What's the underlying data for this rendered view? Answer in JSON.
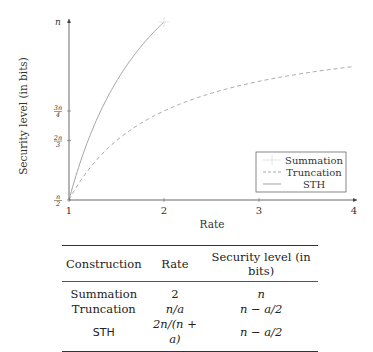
{
  "chart_data": {
    "type": "line",
    "title": "",
    "xlabel": "Rate",
    "ylabel": "Security level (in bits)",
    "xlim": [
      1,
      4
    ],
    "ylim": [
      "n/2",
      "n"
    ],
    "x_ticks": [
      "1",
      "2",
      "3",
      "4"
    ],
    "y_ticks": [
      {
        "label": "n/2",
        "value": 0.5
      },
      {
        "label": "2n/3",
        "value": 0.6667
      },
      {
        "label": "3n/4",
        "value": 0.75
      },
      {
        "label": "n",
        "value": 1.0
      }
    ],
    "y_unit": "fraction of n",
    "grid": false,
    "legend_position": "lower right",
    "series": [
      {
        "name": "Summation",
        "style": "marker (+)",
        "x": [
          2
        ],
        "y": [
          1.0
        ]
      },
      {
        "name": "Truncation",
        "style": "dashed",
        "formula": "n - n/(2r)",
        "x": [
          1,
          1.5,
          2,
          2.5,
          3,
          3.5,
          4
        ],
        "y": [
          0.5,
          0.667,
          0.75,
          0.8,
          0.833,
          0.857,
          0.875
        ]
      },
      {
        "name": "STH",
        "style": "solid",
        "formula": "3n/2 - n/r",
        "x": [
          1,
          1.25,
          1.5,
          1.75,
          2
        ],
        "y": [
          0.5,
          0.7,
          0.833,
          0.929,
          1.0
        ]
      }
    ]
  },
  "table": {
    "headers": [
      "Construction",
      "Rate",
      "Security level (in bits)"
    ],
    "rows": [
      {
        "construction": "Summation",
        "rate": "2",
        "security": "n"
      },
      {
        "construction": "Truncation",
        "rate": "n/a",
        "security": "n − a/2"
      },
      {
        "construction": "STH",
        "rate": "2n/(n + a)",
        "security": "n − a/2"
      }
    ]
  }
}
